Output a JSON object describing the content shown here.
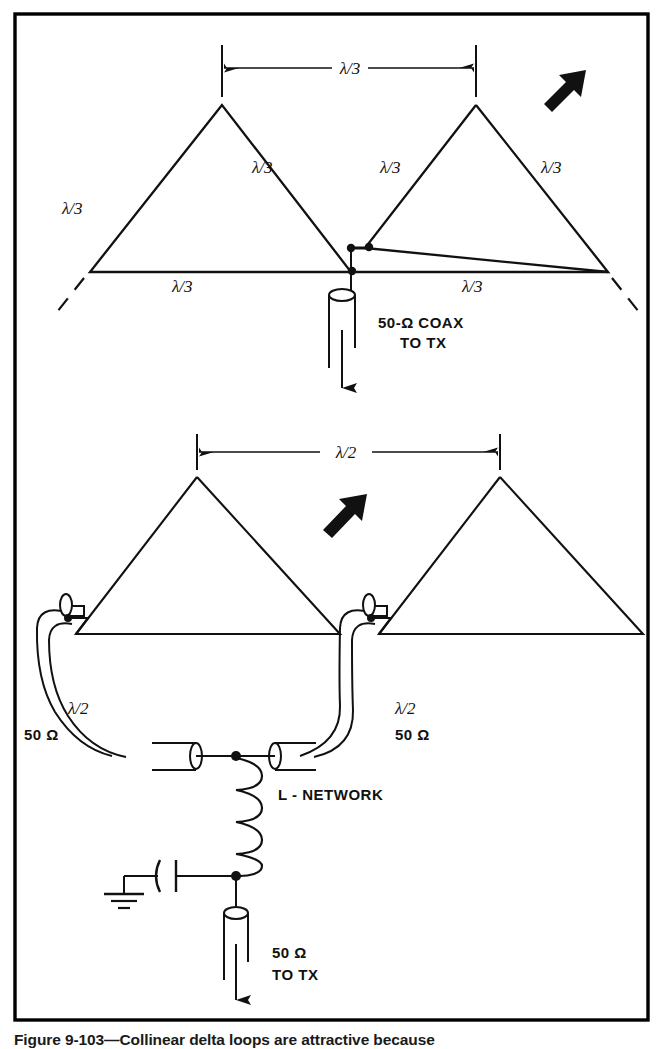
{
  "figure": {
    "caption": "Figure 9-103—Collinear delta loops are attractive because",
    "border_color": "#000000",
    "line_color": "#111111",
    "background": "#ffffff"
  },
  "top_diagram": {
    "name": "two-element-collinear-delta-loop-fed-at-apex-junction",
    "dimension_label": "λ/3",
    "element_side_labels": [
      "λ/3",
      "λ/3",
      "λ/3",
      "λ/3"
    ],
    "element_base_labels": [
      "λ/3",
      "λ/3"
    ],
    "feed_label_line1": "50-Ω COAX",
    "feed_label_line2": "TO TX",
    "direction_arrow": "double-headed-diagonal-arrow"
  },
  "bottom_diagram": {
    "name": "two-element-collinear-delta-loop-with-phasing-lines-and-l-network",
    "dimension_label": "λ/2",
    "left_feedline_label_line1": "λ/2",
    "left_feedline_label_line2": "50 Ω",
    "right_feedline_label_line1": "λ/2",
    "right_feedline_label_line2": "50 Ω",
    "matching_network_label": "L - NETWORK",
    "feed_label_line1": "50 Ω",
    "feed_label_line2": "TO TX",
    "direction_arrow": "double-headed-diagonal-arrow",
    "components": [
      "inductor",
      "capacitor",
      "ground"
    ]
  }
}
